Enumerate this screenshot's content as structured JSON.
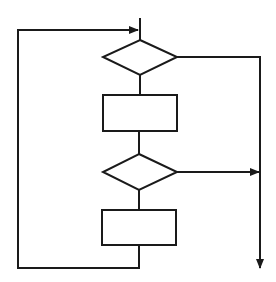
{
  "diagram": {
    "type": "flowchart",
    "colors": {
      "stroke": "#1a1a1a",
      "background": "#ffffff"
    },
    "nodes": [
      {
        "id": "decision-1",
        "shape": "diamond",
        "label": ""
      },
      {
        "id": "process-1",
        "shape": "rectangle",
        "label": ""
      },
      {
        "id": "decision-2",
        "shape": "diamond",
        "label": ""
      },
      {
        "id": "process-2",
        "shape": "rectangle",
        "label": ""
      }
    ],
    "edges": [
      {
        "from": "entry",
        "to": "decision-1"
      },
      {
        "from": "decision-1",
        "to": "process-1"
      },
      {
        "from": "decision-1",
        "to": "exit",
        "direction": "right-then-down"
      },
      {
        "from": "process-1",
        "to": "decision-2"
      },
      {
        "from": "decision-2",
        "to": "exit-line",
        "direction": "right",
        "arrow": true
      },
      {
        "from": "decision-2",
        "to": "process-2"
      },
      {
        "from": "process-2",
        "to": "decision-1",
        "direction": "loop-back-left",
        "arrow": true
      }
    ]
  }
}
